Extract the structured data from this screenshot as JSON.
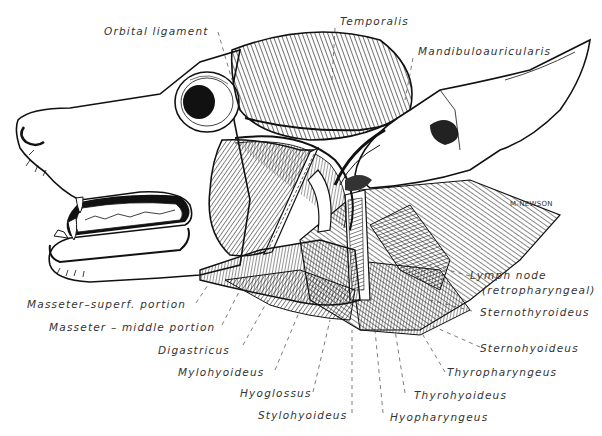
{
  "figure": {
    "signature": "M-NEWSON",
    "colors": {
      "ink": "#111111",
      "label": "#333333",
      "background": "#ffffff"
    }
  },
  "labels": {
    "orbital_ligament": "Orbital ligament",
    "temporalis": "Temporalis",
    "mandibuloauricularis": "Mandibuloauricularis",
    "lymph_node": "Lymph node",
    "lymph_node_sub": "(retropharyngeal)",
    "sternothyroideus": "Sternothyroideus",
    "sternohyoideus": "Sternohyoideus",
    "thyropharyngeus": "Thyropharyngeus",
    "thyrohyoideus": "Thyrohyoideus",
    "hyopharyngeus": "Hyopharyngeus",
    "stylohyoideus": "Stylohyoideus",
    "hyoglossus": "Hyoglossus",
    "mylohyoideus": "Mylohyoideus",
    "digastricus": "Digastricus",
    "masseter_middle": "Masseter – middle portion",
    "masseter_superf": "Masseter–superf. portion"
  }
}
